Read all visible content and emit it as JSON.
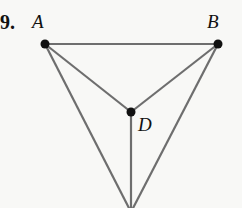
{
  "problem_number": "9.",
  "colors": {
    "line": "#6e6e6e",
    "point": "#111111",
    "background": "#f8f8f6"
  },
  "points": [
    {
      "name": "A",
      "x": 45,
      "y": 44,
      "label_x": 32,
      "label_y": 28
    },
    {
      "name": "B",
      "x": 218,
      "y": 44,
      "label_x": 207,
      "label_y": 28
    },
    {
      "name": "D",
      "x": 131,
      "y": 112,
      "label_x": 138,
      "label_y": 130
    },
    {
      "name": "C",
      "x": 131,
      "y": 212
    }
  ],
  "segments": [
    [
      "A",
      "B"
    ],
    [
      "A",
      "D"
    ],
    [
      "B",
      "D"
    ],
    [
      "D",
      "C"
    ],
    [
      "A",
      "C"
    ],
    [
      "B",
      "C"
    ]
  ],
  "labels": {
    "A": "A",
    "B": "B",
    "D": "D"
  }
}
